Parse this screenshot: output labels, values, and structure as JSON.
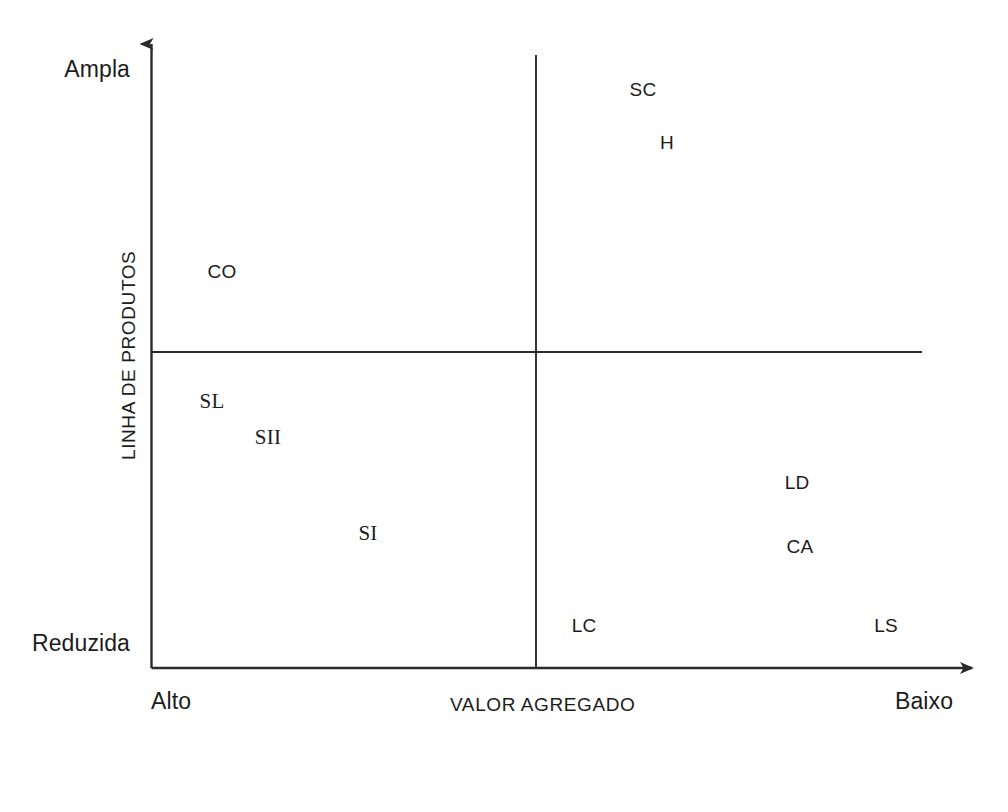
{
  "figure": {
    "background": "#ffffff",
    "line_color": "#2b2b2b",
    "text_color": "#1c1c1c"
  },
  "axes": {
    "y_axis_title": "LINHA DE PRODUTOS",
    "y_top_label": "Ampla",
    "y_bottom_label": "Reduzida",
    "x_axis_title": "VALOR AGREGADO",
    "x_left_label": "Alto",
    "x_right_label": "Baixo"
  },
  "chart_data": {
    "type": "scatter",
    "title": "",
    "subtitle": "",
    "xlabel": "VALOR AGREGADO",
    "ylabel": "LINHA DE PRODUTOS",
    "xlim": [
      0,
      1
    ],
    "ylim": [
      0,
      1
    ],
    "grid": false,
    "legend": "none",
    "x_tick_labels": [
      "Alto",
      "Baixo"
    ],
    "y_tick_labels": [
      "Reduzida",
      "Ampla"
    ],
    "x_axis_direction": "Alto (high value) on left, Baixo (low value) on right",
    "y_axis_direction": "Reduzida (narrow) at bottom, Ampla (broad) at top",
    "quadrant_divider_x": 0.461,
    "quadrant_divider_y": 0.497,
    "markers_visible": false,
    "labels_only": true,
    "points": [
      {
        "label": "SC",
        "x": 0.59,
        "y": 0.909,
        "quadrant": "upper-right",
        "font": "sans",
        "px": 643,
        "py": 90
      },
      {
        "label": "H",
        "x": 0.619,
        "y": 0.826,
        "quadrant": "upper-right",
        "font": "sans",
        "px": 667,
        "py": 143
      },
      {
        "label": "CO",
        "x": 0.085,
        "y": 0.623,
        "quadrant": "upper-left",
        "font": "sans",
        "px": 222,
        "py": 272
      },
      {
        "label": "SL",
        "x": 0.073,
        "y": 0.42,
        "quadrant": "lower-left",
        "font": "serif",
        "px": 212,
        "py": 401
      },
      {
        "label": "SII",
        "x": 0.14,
        "y": 0.363,
        "quadrant": "lower-left",
        "font": "serif",
        "px": 268,
        "py": 437
      },
      {
        "label": "SI",
        "x": 0.26,
        "y": 0.212,
        "quadrant": "lower-left",
        "font": "serif",
        "px": 368,
        "py": 533
      },
      {
        "label": "LD",
        "x": 0.775,
        "y": 0.291,
        "quadrant": "lower-right",
        "font": "sans",
        "px": 797,
        "py": 483
      },
      {
        "label": "CA",
        "x": 0.778,
        "y": 0.19,
        "quadrant": "lower-right",
        "font": "sans",
        "px": 800,
        "py": 547
      },
      {
        "label": "LC",
        "x": 0.519,
        "y": 0.066,
        "quadrant": "lower-right",
        "font": "sans",
        "px": 584,
        "py": 626
      },
      {
        "label": "LS",
        "x": 0.881,
        "y": 0.066,
        "quadrant": "lower-right",
        "font": "sans",
        "px": 886,
        "py": 626
      }
    ]
  }
}
